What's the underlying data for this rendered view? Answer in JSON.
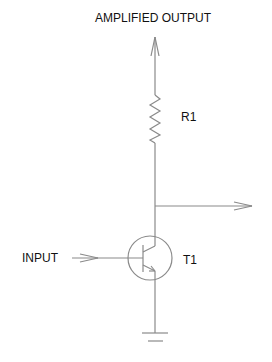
{
  "diagram": {
    "type": "transistor amplifier schematic",
    "labels": {
      "output": "AMPLIFIED OUTPUT",
      "resistor": "R1",
      "transistor": "T1",
      "input": "INPUT"
    },
    "components": [
      {
        "id": "R1",
        "kind": "resistor"
      },
      {
        "id": "T1",
        "kind": "NPN transistor"
      },
      {
        "id": "GND",
        "kind": "ground"
      }
    ],
    "colors": {
      "line": "#8a8a8a",
      "text": "#111111",
      "background": "#ffffff"
    }
  }
}
